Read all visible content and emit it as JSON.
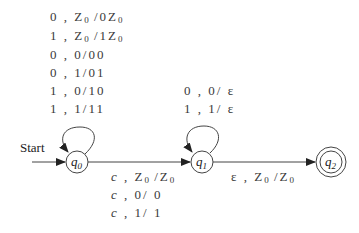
{
  "diagram": {
    "type": "pushdown-automaton",
    "start_label": "Start",
    "states": [
      {
        "id": "q0",
        "label": "q",
        "sub": "0",
        "accepting": false,
        "start": true
      },
      {
        "id": "q1",
        "label": "q",
        "sub": "1",
        "accepting": false,
        "start": false
      },
      {
        "id": "q2",
        "label": "q",
        "sub": "2",
        "accepting": true,
        "start": false
      }
    ],
    "q0_loop": [
      {
        "in": "0",
        "pop": "Z",
        "pop_sub": "0",
        "push": "0Z",
        "push_sub": "0"
      },
      {
        "in": "1",
        "pop": "Z",
        "pop_sub": "0",
        "push": "1Z",
        "push_sub": "0"
      },
      {
        "in": "0",
        "pop": "0",
        "push": "00"
      },
      {
        "in": "0",
        "pop": "1",
        "push": "01"
      },
      {
        "in": "1",
        "pop": "0",
        "push": "10"
      },
      {
        "in": "1",
        "pop": "1",
        "push": "11"
      }
    ],
    "q1_loop": [
      {
        "in": "0",
        "pop": "0",
        "push": "ε"
      },
      {
        "in": "1",
        "pop": "1",
        "push": "ε"
      }
    ],
    "q0_to_q1": [
      {
        "in": "c",
        "pop": "Z",
        "pop_sub": "0",
        "push": "Z",
        "push_sub": "0"
      },
      {
        "in": "c",
        "pop": "0",
        "push": "0"
      },
      {
        "in": "c",
        "pop": "1",
        "push": "1"
      }
    ],
    "q1_to_q2": [
      {
        "in": "ε",
        "pop": "Z",
        "pop_sub": "0",
        "push": "Z",
        "push_sub": "0"
      }
    ],
    "text": {
      "comma": ",",
      "slash": "/"
    }
  }
}
